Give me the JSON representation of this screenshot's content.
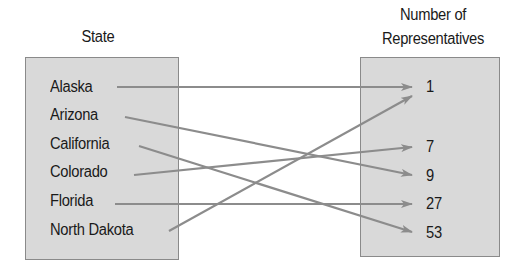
{
  "domain_labels": {
    "left_title": "State",
    "right_title_line1": "Number of",
    "right_title_line2": "Representatives"
  },
  "states": [
    "Alaska",
    "Arizona",
    "California",
    "Colorado",
    "Florida",
    "North Dakota"
  ],
  "representatives": [
    "1",
    "7",
    "9",
    "27",
    "53"
  ],
  "mappings": [
    {
      "state": "Alaska",
      "value": "1"
    },
    {
      "state": "Arizona",
      "value": "9"
    },
    {
      "state": "California",
      "value": "53"
    },
    {
      "state": "Colorado",
      "value": "7"
    },
    {
      "state": "Florida",
      "value": "27"
    },
    {
      "state": "North Dakota",
      "value": "1"
    }
  ],
  "colors": {
    "box_fill": "#d9d9d9",
    "box_border": "#8a8a8a",
    "arrow": "#8c8c8c",
    "text": "#1a1a1a"
  }
}
